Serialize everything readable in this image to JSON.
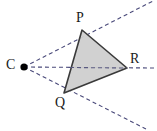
{
  "figure": {
    "background_color": "#ffffff",
    "width": 157,
    "height": 131,
    "labels": {
      "P": "P",
      "Q": "Q",
      "R": "R",
      "C": "C"
    },
    "points": {
      "C": {
        "x": 24,
        "y": 67,
        "marker": "filled-dot",
        "radius": 3.6,
        "color": "#000000"
      },
      "P": {
        "x": 82,
        "y": 30
      },
      "Q": {
        "x": 64,
        "y": 93
      },
      "R": {
        "x": 127,
        "y": 68
      }
    },
    "triangle": {
      "name": "PQR",
      "vertices": [
        "P",
        "Q",
        "R"
      ],
      "fill": "#cfcfcf",
      "stroke": "#3a3a3a",
      "stroke_width": 1.6
    },
    "rays": [
      {
        "name": "ray-C-through-P",
        "from": "C",
        "through": "P",
        "x1": 24,
        "y1": 67,
        "x2": 153,
        "y2": 1
      },
      {
        "name": "ray-C-through-R",
        "from": "C",
        "through": "R",
        "x1": 24,
        "y1": 67,
        "x2": 155,
        "y2": 68
      },
      {
        "name": "ray-C-through-Q",
        "from": "C",
        "through": "Q",
        "x1": 24,
        "y1": 67,
        "x2": 146,
        "y2": 129
      }
    ],
    "ray_style": {
      "stroke": "#4a4a7a",
      "stroke_width": 1.1,
      "dash": "4 3"
    }
  },
  "chart_data": {
    "type": "diagram",
    "subtype": "geometry-central-projection",
    "points": [
      {
        "label": "C",
        "x": 24,
        "y": 67,
        "role": "center-of-projection",
        "marked": true
      },
      {
        "label": "P",
        "x": 82,
        "y": 30,
        "role": "triangle-vertex",
        "marked": false
      },
      {
        "label": "Q",
        "x": 64,
        "y": 93,
        "role": "triangle-vertex",
        "marked": false
      },
      {
        "label": "R",
        "x": 127,
        "y": 68,
        "role": "triangle-vertex",
        "marked": false
      }
    ],
    "shapes": [
      {
        "type": "polygon",
        "label": "PQR",
        "vertices": [
          "P",
          "Q",
          "R"
        ],
        "style": "solid",
        "fill": "#cfcfcf",
        "stroke": "#3a3a3a"
      }
    ],
    "lines": [
      {
        "type": "ray",
        "from": "C",
        "through": "P",
        "style": "dashed"
      },
      {
        "type": "ray",
        "from": "C",
        "through": "R",
        "style": "dashed"
      },
      {
        "type": "ray",
        "from": "C",
        "through": "Q",
        "style": "dashed"
      }
    ],
    "legend": [],
    "annotations": []
  }
}
